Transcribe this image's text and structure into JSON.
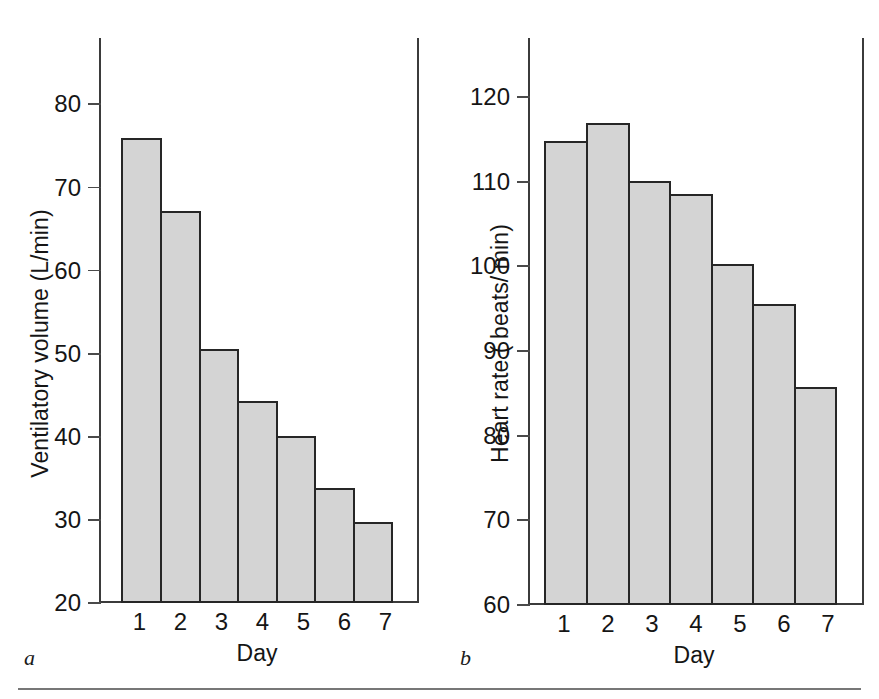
{
  "figure": {
    "panels": [
      {
        "letter": "a",
        "ylabel": "Ventilatory volume (L/min)",
        "xlabel": "Day"
      },
      {
        "letter": "b",
        "ylabel": "Heart rate ( beats/ min)",
        "xlabel": "Day"
      }
    ],
    "bar_fill_color": "#d4d4d4",
    "bar_edge_color": "#262626",
    "axis_color": "#3b3b3b",
    "rule_color": "#777777"
  },
  "chart_data": [
    {
      "type": "bar",
      "panel": "a",
      "title": "",
      "xlabel": "Day",
      "ylabel": "Ventilatory volume (L/min)",
      "categories": [
        "1",
        "2",
        "3",
        "4",
        "5",
        "6",
        "7"
      ],
      "values": [
        76.0,
        67.2,
        50.6,
        44.3,
        40.1,
        33.9,
        29.8
      ],
      "ylim": [
        20,
        88
      ],
      "yticks": [
        20,
        30,
        40,
        50,
        60,
        70,
        80
      ],
      "ytick_labels": [
        "20",
        "30",
        "40",
        "50",
        "60",
        "70",
        "80"
      ],
      "grid": false,
      "legend": "none"
    },
    {
      "type": "bar",
      "panel": "b",
      "title": "",
      "xlabel": "Day",
      "ylabel": "Heart rate ( beats/ min)",
      "categories": [
        "1",
        "2",
        "3",
        "4",
        "5",
        "6",
        "7"
      ],
      "values": [
        114.8,
        117.0,
        110.1,
        108.6,
        100.3,
        95.6,
        85.8
      ],
      "ylim": [
        60,
        127
      ],
      "yticks": [
        60,
        70,
        80,
        90,
        100,
        110,
        120
      ],
      "ytick_labels": [
        "60",
        "70",
        "80",
        "90",
        "100",
        "110",
        "120"
      ],
      "grid": false,
      "legend": "none"
    }
  ]
}
